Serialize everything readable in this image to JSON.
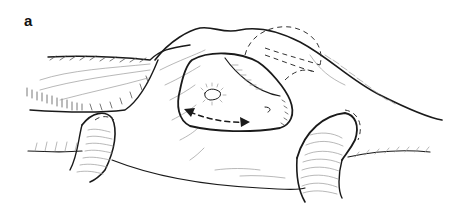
{
  "figure": {
    "panel_label": "a",
    "colors": {
      "ink": "#1a1a1a",
      "hatch": "#9a9a9a",
      "background": "#ffffff"
    },
    "annotations": [
      {
        "type": "double-headed-dashed-arrow",
        "location": "inside central opening"
      }
    ]
  }
}
